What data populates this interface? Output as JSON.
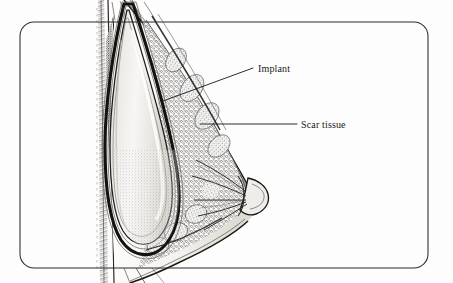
{
  "figure": {
    "background_color": "#fdfdfd",
    "frame": {
      "name": "rounded-border",
      "stroke_color": "#2b2b2b",
      "x": 20,
      "y": 22,
      "width": 408,
      "height": 246,
      "corner_radius": 14
    },
    "labels": [
      {
        "id": "implant",
        "text": "Implant",
        "text_x": 258,
        "text_y": 72,
        "leader": {
          "from_x": 163,
          "from_y": 101,
          "to_x": 253,
          "to_y": 68
        }
      },
      {
        "id": "scar-tissue",
        "text": "Scar tissue",
        "text_x": 301,
        "text_y": 128,
        "leader": {
          "from_x": 200,
          "from_y": 124,
          "to_x": 297,
          "to_y": 124
        }
      }
    ],
    "anatomy": {
      "chest_wall_label": "chest wall",
      "implant_label": "implant shell",
      "capsule_label": "fibrous capsule",
      "gland_label": "glandular tissue",
      "nipple_label": "nipple areola complex",
      "skin_label": "skin contour"
    },
    "colors": {
      "ink": "#161616",
      "implant_fill": "#e9e7e2",
      "implant_highlight": "#f6f5f2",
      "tissue_dark": "#4a4641",
      "tissue_mid": "#8d8880",
      "paper": "#fdfdfd"
    }
  }
}
